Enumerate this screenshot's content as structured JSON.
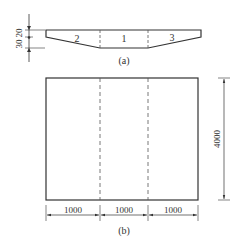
{
  "section_view": {
    "caption": "(a)",
    "regions": [
      {
        "id": "2",
        "label": "2"
      },
      {
        "id": "1",
        "label": "1"
      },
      {
        "id": "3",
        "label": "3"
      }
    ],
    "dimensions": {
      "top_thickness": "20",
      "bottom_thickness": "30"
    }
  },
  "plan_view": {
    "caption": "(b)",
    "width_segments": [
      "1000",
      "1000",
      "1000"
    ],
    "height": "4000"
  },
  "colors": {
    "line": "#333333",
    "dashed": "#555555",
    "background": "#ffffff"
  }
}
